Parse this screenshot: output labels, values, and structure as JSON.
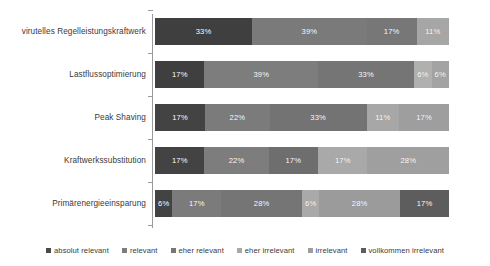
{
  "chart_data": {
    "type": "bar",
    "orientation": "horizontal",
    "stacked": true,
    "normalized_percent": true,
    "title": "",
    "subtitle": "",
    "xlabel": "",
    "ylabel": "",
    "xlim": [
      0,
      100
    ],
    "grid": false,
    "legend_position": "bottom",
    "value_suffix": "%",
    "categories": [
      "virutelles Regelleistungskraftwerk",
      "Lastflussoptimierung",
      "Peak Shaving",
      "Kraftwerkssubstitution",
      "Primärenergieeinsparung"
    ],
    "series": [
      {
        "name": "absolut relevant",
        "color": "#3f3f3f",
        "values": [
          33,
          17,
          17,
          17,
          6
        ]
      },
      {
        "name": "relevant",
        "color": "#7a7a7a",
        "values": [
          39,
          39,
          22,
          22,
          17
        ]
      },
      {
        "name": "eher relevant",
        "color": "#707070",
        "values": [
          17,
          33,
          33,
          17,
          28
        ]
      },
      {
        "name": "eher irrelevant",
        "color": "#a8a8a8",
        "values": [
          11,
          6,
          11,
          17,
          6
        ]
      },
      {
        "name": "irrelevant",
        "color": "#9d9d9d",
        "values": [
          0,
          6,
          17,
          28,
          28
        ]
      },
      {
        "name": "vollkommen irrelevant",
        "color": "#5d5d5d",
        "values": [
          0,
          0,
          0,
          0,
          17
        ]
      }
    ],
    "bars": [
      {
        "category": "virutelles Regelleistungskraftwerk",
        "segments": [
          {
            "series": "absolut relevant",
            "value": 33,
            "label": "33%",
            "color": "#3f3f3f"
          },
          {
            "series": "relevant",
            "value": 39,
            "label": "39%",
            "color": "#7a7a7a"
          },
          {
            "series": "eher relevant",
            "value": 17,
            "label": "17%",
            "color": "#777777"
          },
          {
            "series": "eher irrelevant",
            "value": 11,
            "label": "11%",
            "color": "#a6a6a6"
          }
        ]
      },
      {
        "category": "Lastflussoptimierung",
        "segments": [
          {
            "series": "absolut relevant",
            "value": 17,
            "label": "17%",
            "color": "#3f3f3f"
          },
          {
            "series": "relevant",
            "value": 39,
            "label": "39%",
            "color": "#7d7d7d"
          },
          {
            "series": "eher relevant",
            "value": 33,
            "label": "33%",
            "color": "#757575"
          },
          {
            "series": "eher irrelevant",
            "value": 6,
            "label": "6%",
            "color": "#b0b0b0"
          },
          {
            "series": "irrelevant",
            "value": 6,
            "label": "6%",
            "color": "#a3a3a3"
          }
        ]
      },
      {
        "category": "Peak Shaving",
        "segments": [
          {
            "series": "absolut relevant",
            "value": 17,
            "label": "17%",
            "color": "#434343"
          },
          {
            "series": "relevant",
            "value": 22,
            "label": "22%",
            "color": "#7b7b7b"
          },
          {
            "series": "eher relevant",
            "value": 33,
            "label": "33%",
            "color": "#737373"
          },
          {
            "series": "eher irrelevant",
            "value": 11,
            "label": "11%",
            "color": "#a7a7a7"
          },
          {
            "series": "irrelevant",
            "value": 17,
            "label": "17%",
            "color": "#9e9e9e"
          }
        ]
      },
      {
        "category": "Kraftwerkssubstitution",
        "segments": [
          {
            "series": "absolut relevant",
            "value": 17,
            "label": "17%",
            "color": "#434343"
          },
          {
            "series": "relevant",
            "value": 22,
            "label": "22%",
            "color": "#7d7d7d"
          },
          {
            "series": "eher relevant",
            "value": 17,
            "label": "17%",
            "color": "#6e6e6e"
          },
          {
            "series": "eher irrelevant",
            "value": 17,
            "label": "17%",
            "color": "#a9a9a9"
          },
          {
            "series": "irrelevant",
            "value": 28,
            "label": "28%",
            "color": "#9f9f9f"
          }
        ]
      },
      {
        "category": "Primärenergieeinsparung",
        "segments": [
          {
            "series": "absolut relevant",
            "value": 6,
            "label": "6%",
            "color": "#434343"
          },
          {
            "series": "relevant",
            "value": 17,
            "label": "17%",
            "color": "#7b7b7b"
          },
          {
            "series": "eher relevant",
            "value": 28,
            "label": "28%",
            "color": "#757575"
          },
          {
            "series": "eher irrelevant",
            "value": 6,
            "label": "6%",
            "color": "#a9a9a9"
          },
          {
            "series": "irrelevant",
            "value": 28,
            "label": "28%",
            "color": "#9b9b9b"
          },
          {
            "series": "vollkommen irrelevant",
            "value": 17,
            "label": "17%",
            "color": "#5d5d5d"
          }
        ]
      }
    ],
    "legend": [
      {
        "label": "absolut relevant",
        "color": "#4a4a4a"
      },
      {
        "label": "relevant",
        "color": "#7d7d7d"
      },
      {
        "label": "eher relevant",
        "color": "#767676"
      },
      {
        "label": "eher irrelevant",
        "color": "#a8a8a8"
      },
      {
        "label": "irrelevant",
        "color": "#9d9d9d"
      },
      {
        "label": "vollkommen irrelevant",
        "color": "#5d5d5d"
      }
    ]
  },
  "colors": {
    "background": "#ffffff",
    "axis": "#9a9a9a",
    "text": "#3a3a3a",
    "value_text": "#ffffff"
  }
}
